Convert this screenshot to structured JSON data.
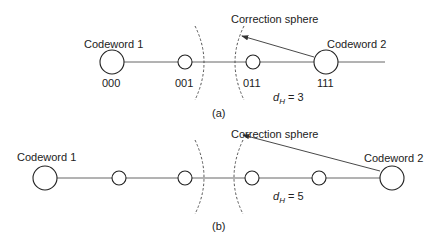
{
  "panel_a": {
    "caption": "(a)",
    "codeword1_label": "Codeword 1",
    "codeword2_label": "Codeword 2",
    "sphere_label": "Correction sphere",
    "distance_label_prefix": "d",
    "distance_subscript": "H",
    "distance_value": " = 3",
    "nodes": [
      {
        "bits": "000",
        "type": "codeword"
      },
      {
        "bits": "001",
        "type": "intermediate"
      },
      {
        "bits": "011",
        "type": "intermediate"
      },
      {
        "bits": "111",
        "type": "codeword"
      }
    ]
  },
  "panel_b": {
    "caption": "(b)",
    "codeword1_label": "Codeword 1",
    "codeword2_label": "Codeword 2",
    "sphere_label": "Correction sphere",
    "distance_label_prefix": "d",
    "distance_subscript": "H",
    "distance_value": " = 5",
    "nodes": [
      {
        "type": "codeword"
      },
      {
        "type": "intermediate"
      },
      {
        "type": "intermediate"
      },
      {
        "type": "intermediate"
      },
      {
        "type": "intermediate"
      },
      {
        "type": "codeword"
      }
    ]
  }
}
